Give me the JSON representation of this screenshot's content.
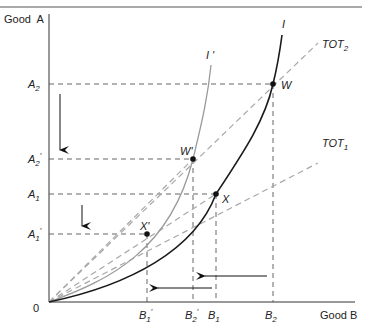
{
  "diagram": {
    "axes": {
      "y_label": "Good  A",
      "x_label": "Good B",
      "origin_label": "0"
    },
    "y_ticks": [
      {
        "id": "A2",
        "base": "A",
        "sub": "2",
        "prime": "",
        "y": 84
      },
      {
        "id": "A2p",
        "base": "A",
        "sub": "2",
        "prime": "′",
        "y": 159
      },
      {
        "id": "A1",
        "base": "A",
        "sub": "1",
        "prime": "",
        "y": 194
      },
      {
        "id": "A1p",
        "base": "A",
        "sub": "1",
        "prime": "′",
        "y": 234
      }
    ],
    "x_ticks": [
      {
        "id": "B1p",
        "base": "B",
        "sub": "1",
        "prime": "′",
        "x": 147
      },
      {
        "id": "B2p",
        "base": "B",
        "sub": "2",
        "prime": "′",
        "x": 193
      },
      {
        "id": "B1",
        "base": "B",
        "sub": "1",
        "prime": "",
        "x": 216
      },
      {
        "id": "B2",
        "base": "B",
        "sub": "2",
        "prime": "",
        "x": 273
      }
    ],
    "curves": {
      "I": {
        "label": "I",
        "color": "#1a1a1a"
      },
      "I_prime": {
        "label": "I '",
        "color": "#9a9a9a"
      }
    },
    "rays": {
      "TOT2": {
        "base": "TOT",
        "sub": "2",
        "color": "#a8a8a8"
      },
      "TOT1": {
        "base": "TOT",
        "sub": "1",
        "color": "#a8a8a8"
      }
    },
    "points": {
      "W": {
        "label": "W"
      },
      "W_prime": {
        "label": "W'"
      },
      "X": {
        "label": "X"
      },
      "X_prime": {
        "label": "X'"
      }
    },
    "colors": {
      "axis": "#333333",
      "guide": "#555555",
      "border": "#555555"
    }
  }
}
